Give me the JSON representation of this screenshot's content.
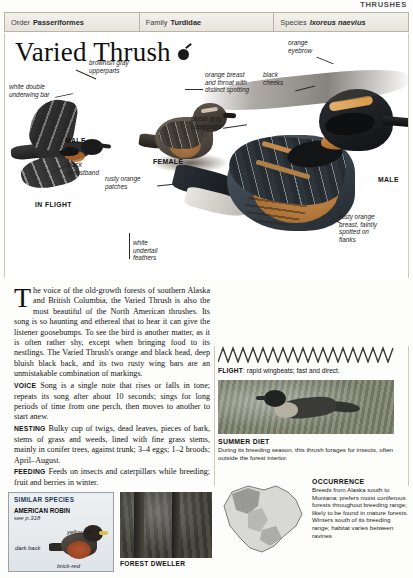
{
  "running_head": "THRUSHES",
  "taxonomy": [
    {
      "label": "Order",
      "value": "Passeriformes",
      "italic": false
    },
    {
      "label": "Family",
      "value": "Turdidae",
      "italic": false
    },
    {
      "label": "Species",
      "value": "Ixoreus naevius",
      "italic": true
    }
  ],
  "title": "Varied Thrush",
  "plate_labels": {
    "brownish_gray": "brownish gray\nupperparts",
    "white_double": "white double\nunderwing bar",
    "orange_breast": "orange breast\nand throat with\ndistinct spotting",
    "bluish_gray": "bluish gray\nupperparts",
    "orange_eyebrow": "orange\neyebrow",
    "black_cheeks": "black\ncheeks",
    "black_breastband": "black\nbreastband",
    "rusty_orange_patches": "rusty orange\npatches",
    "white_undertail": "white\nundertail\nfeathers",
    "rusty_orange_breast": "rusty orange\nbreast, faintly\nspotted on\nflanks"
  },
  "plate_captions": {
    "male_flight": "MALE",
    "in_flight": "IN FLIGHT",
    "female": "FEMALE",
    "male_perched": "MALE"
  },
  "body": {
    "dropcap": "T",
    "intro": "he voice of the old-growth forests of southern Alaska and British Columbia, the Varied Thrush is also the most beautiful of the North American thrushes. Its song is so haunting and ethereal that to hear it can give the listener goosebumps. To see the bird is another matter, as it is often rather shy, except when bringing food to its nestlings. The Varied Thrush's orange and black head, deep bluish black back, and its two rusty wing bars are an unmistakable combination of markings.",
    "sections": [
      {
        "label": "VOICE",
        "text": "Song is a single note that rises or falls in tone; repeats its song after about 10 seconds; sings for long periods of time from one perch, then moves to another to start anew."
      },
      {
        "label": "NESTING",
        "text": "Bulky cup of twigs, dead leaves, pieces of bark, stems of grass and weeds, lined with fine grass stems, mainly in conifer trees, against trunk; 3–4 eggs; 1–2 broods; April–August."
      },
      {
        "label": "FEEDING",
        "text": "Feeds on insects and caterpillars while breeding; fruit and berries in winter."
      }
    ]
  },
  "flight": {
    "label": "FLIGHT",
    "text": "rapid wingbeats; fast and direct."
  },
  "summer_diet": {
    "heading": "SUMMER DIET",
    "text": "During its breeding season, this thrush forages for insects, often outside the forest interior."
  },
  "occurrence": {
    "heading": "OCCURRENCE",
    "text": "Breeds from Alaska south to Montana; prefers moist coniferous forests throughout breeding range; likely to be found in mature forests. Winters south of its breeding range; habitat varies between ravines"
  },
  "forest_dweller": {
    "caption": "FOREST DWELLER"
  },
  "similar_species": {
    "title": "SIMILAR SPECIES",
    "name": "AMERICAN\nROBIN",
    "page": "see p.318",
    "labels": [
      "yellow\nbill",
      "dark\nback",
      "brick-red"
    ]
  },
  "colors": {
    "rule": "#b9b4a8",
    "sim_title": "#1b3a5c",
    "orange": "#c0802f"
  }
}
